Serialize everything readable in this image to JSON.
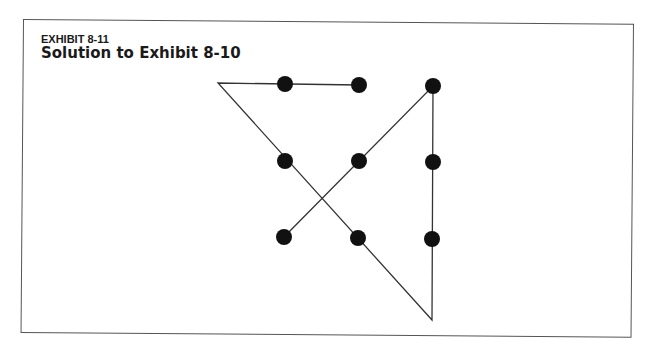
{
  "exhibit": {
    "label": "EXHIBIT 8-11",
    "title": "Solution to Exhibit 8-10"
  },
  "diagram": {
    "type": "nine-dot-puzzle-solution",
    "line_color": "#333333",
    "dot_color": "#111111",
    "dot_radius": 8,
    "dots": [
      {
        "row": 0,
        "col": 0,
        "x": 285,
        "y": 84
      },
      {
        "row": 0,
        "col": 1,
        "x": 359,
        "y": 85
      },
      {
        "row": 0,
        "col": 2,
        "x": 433,
        "y": 86
      },
      {
        "row": 1,
        "col": 0,
        "x": 285,
        "y": 161
      },
      {
        "row": 1,
        "col": 1,
        "x": 359,
        "y": 161
      },
      {
        "row": 1,
        "col": 2,
        "x": 433,
        "y": 162
      },
      {
        "row": 2,
        "col": 0,
        "x": 284,
        "y": 237
      },
      {
        "row": 2,
        "col": 1,
        "x": 358,
        "y": 238
      },
      {
        "row": 2,
        "col": 2,
        "x": 432,
        "y": 239
      }
    ],
    "path": [
      {
        "x": 359,
        "y": 85
      },
      {
        "x": 218,
        "y": 83
      },
      {
        "x": 432,
        "y": 320
      },
      {
        "x": 433,
        "y": 86
      },
      {
        "x": 284,
        "y": 237
      }
    ]
  }
}
